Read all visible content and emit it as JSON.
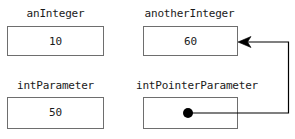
{
  "diagram": {
    "background_color": "#ffffff",
    "box_border_color": "#6e6e6e",
    "text_color": "#1a1a1a",
    "pointer_color": "#000000",
    "variables": [
      {
        "id": "anInteger",
        "label": "anInteger",
        "value": "10",
        "kind": "integer"
      },
      {
        "id": "anotherInteger",
        "label": "anotherInteger",
        "value": "60",
        "kind": "integer"
      },
      {
        "id": "intParameter",
        "label": "intParameter",
        "value": "50",
        "kind": "integer"
      },
      {
        "id": "intPointerParameter",
        "label": "intPointerParameter",
        "value": "",
        "kind": "pointer"
      }
    ],
    "pointer_link": {
      "from": "intPointerParameter",
      "to": "anotherInteger",
      "arrow_head": "left-arrow-icon",
      "dot": "pointer-origin-dot-icon"
    }
  }
}
